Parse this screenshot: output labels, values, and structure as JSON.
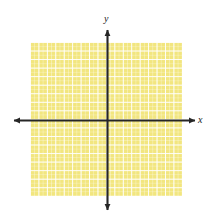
{
  "figure": {
    "type": "coordinate-plane",
    "title": "",
    "background_color": "#ffffff"
  },
  "plot_area": {
    "fill_color": "#f2e67f",
    "grid_line_color": "#ffffff",
    "left_px": 30,
    "top_px": 42,
    "width_px": 152,
    "height_px": 154,
    "columns": 18,
    "rows": 18,
    "cell_width_px": 8.45,
    "cell_height_px": 8.55
  },
  "axes": {
    "color": "#262626",
    "origin_x_px": 107,
    "origin_y_px": 120,
    "x_axis": {
      "label": "x",
      "start_px": 12,
      "end_px": 196,
      "arrow_left": true,
      "arrow_right": true
    },
    "y_axis": {
      "label": "y",
      "start_px": 28,
      "end_px": 212,
      "arrow_up": true,
      "arrow_down": true
    },
    "tick_labels": [],
    "gridlines_visible": true
  },
  "chart_data": {
    "type": "scatter",
    "title": "",
    "subtitle": "",
    "xlabel": "x",
    "ylabel": "y",
    "series": [],
    "x": [],
    "values": [],
    "xlim": [
      -9,
      9
    ],
    "ylim": [
      -9,
      9
    ],
    "xticks": [],
    "yticks": [],
    "grid": true,
    "legend": null,
    "annotations": []
  }
}
